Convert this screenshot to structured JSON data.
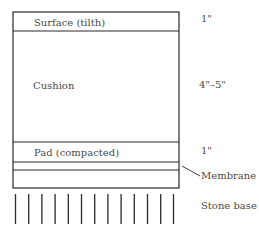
{
  "diagram": {
    "layers": [
      {
        "name": "Surface (tilth)",
        "thickness": "1\""
      },
      {
        "name": "Cushion",
        "thickness": "4\"–5\""
      },
      {
        "name": "Pad (compacted)",
        "thickness": "1\""
      },
      {
        "name": "",
        "thickness": ""
      }
    ],
    "membrane_label": "Membrane",
    "base_label": "Stone base",
    "stone_line_count": 13,
    "stroke_color": "#2a2a2a"
  }
}
